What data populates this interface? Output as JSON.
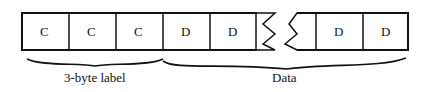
{
  "diagram": {
    "cells_left": [
      "C",
      "C",
      "C",
      "D",
      "D"
    ],
    "cells_right": [
      "D",
      "D"
    ],
    "braces": {
      "label": "3-byte label",
      "data": "Data"
    }
  }
}
